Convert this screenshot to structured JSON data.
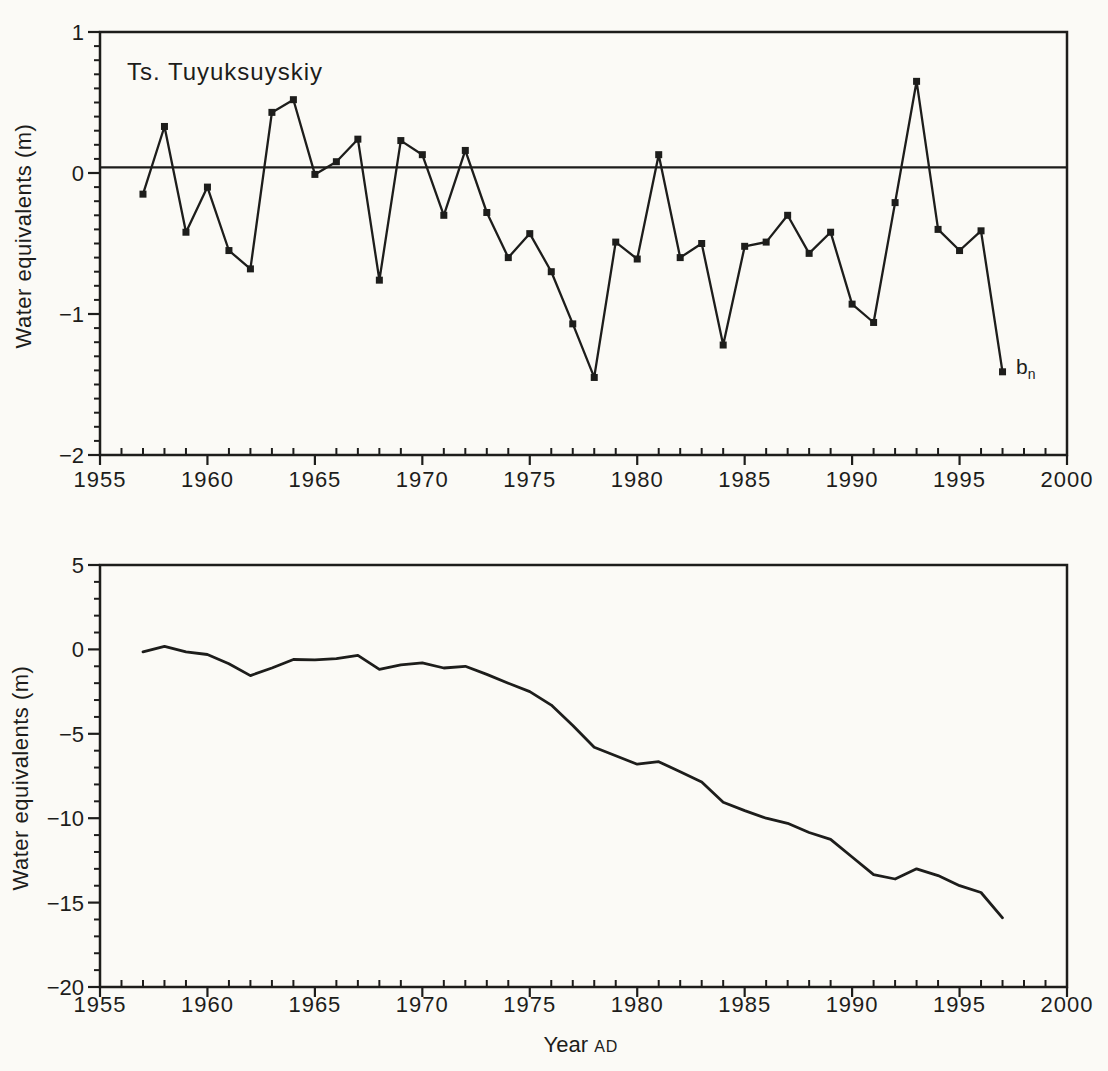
{
  "page": {
    "background": "#fbfaf6",
    "ink": "#1d1d1b"
  },
  "chart_data": [
    {
      "id": "annual",
      "type": "line",
      "title": "Ts. Tuyuksuyskiy",
      "ylabel": "Water equivalents (m)",
      "series_label": {
        "base": "b",
        "sub": "n"
      },
      "legend_position": "none",
      "grid": false,
      "marker": "square",
      "xlim": [
        1955,
        2000
      ],
      "ylim": [
        -2,
        1
      ],
      "x_minor_step": 1,
      "y_minor_step": 0.1,
      "x_major_ticks": [
        1955,
        1960,
        1965,
        1970,
        1975,
        1980,
        1985,
        1990,
        1995,
        2000
      ],
      "x_major_labels": [
        "1955",
        "1960",
        "1965",
        "1970",
        "1975",
        "1980",
        "1985",
        "1990",
        "1995",
        "2000"
      ],
      "y_major_ticks": [
        1,
        0,
        -1,
        -2
      ],
      "y_major_labels": [
        "1",
        "0",
        "−1",
        "−2"
      ],
      "reference_line_y": 0.04,
      "x": [
        1957,
        1958,
        1959,
        1960,
        1961,
        1962,
        1963,
        1964,
        1965,
        1966,
        1967,
        1968,
        1969,
        1970,
        1971,
        1972,
        1973,
        1974,
        1975,
        1976,
        1977,
        1978,
        1979,
        1980,
        1981,
        1982,
        1983,
        1984,
        1985,
        1986,
        1987,
        1988,
        1989,
        1990,
        1991,
        1992,
        1993,
        1994,
        1995,
        1996,
        1997
      ],
      "values": [
        -0.15,
        0.33,
        -0.42,
        -0.1,
        -0.55,
        -0.68,
        0.43,
        0.52,
        -0.01,
        0.08,
        0.24,
        -0.76,
        0.23,
        0.13,
        -0.3,
        0.16,
        -0.28,
        -0.6,
        -0.43,
        -0.7,
        -1.07,
        -1.45,
        -0.49,
        -0.61,
        0.13,
        -0.6,
        -0.5,
        -1.22,
        -0.52,
        -0.49,
        -0.3,
        -0.57,
        -0.42,
        -0.93,
        -1.06,
        -0.21,
        0.65,
        -0.4,
        -0.55,
        -0.41,
        -1.41
      ]
    },
    {
      "id": "cumulative",
      "type": "line",
      "title": "",
      "ylabel": "Water equivalents (m)",
      "xlabel": {
        "text": "Year",
        "suffix": "AD"
      },
      "legend_position": "none",
      "grid": false,
      "marker": "none",
      "xlim": [
        1955,
        2000
      ],
      "ylim": [
        -20,
        5
      ],
      "x_minor_step": 1,
      "y_minor_step": 1,
      "x_major_ticks": [
        1955,
        1960,
        1965,
        1970,
        1975,
        1980,
        1985,
        1990,
        1995,
        2000
      ],
      "x_major_labels": [
        "1955",
        "1960",
        "1965",
        "1970",
        "1975",
        "1980",
        "1985",
        "1990",
        "1995",
        "2000"
      ],
      "y_major_ticks": [
        5,
        0,
        -5,
        -10,
        -15,
        -20
      ],
      "y_major_labels": [
        "5",
        "0",
        "−5",
        "−10",
        "−15",
        "−20"
      ],
      "x": [
        1957,
        1958,
        1959,
        1960,
        1961,
        1962,
        1963,
        1964,
        1965,
        1966,
        1967,
        1968,
        1969,
        1970,
        1971,
        1972,
        1973,
        1974,
        1975,
        1976,
        1977,
        1978,
        1979,
        1980,
        1981,
        1982,
        1983,
        1984,
        1985,
        1986,
        1987,
        1988,
        1989,
        1990,
        1991,
        1992,
        1993,
        1994,
        1995,
        1996,
        1997
      ],
      "values": [
        -0.15,
        0.18,
        -0.15,
        -0.3,
        -0.85,
        -1.55,
        -1.1,
        -0.6,
        -0.62,
        -0.55,
        -0.35,
        -1.18,
        -0.92,
        -0.8,
        -1.1,
        -1.0,
        -1.48,
        -2.0,
        -2.5,
        -3.3,
        -4.5,
        -5.8,
        -6.3,
        -6.8,
        -6.65,
        -7.25,
        -7.85,
        -9.05,
        -9.55,
        -10.0,
        -10.3,
        -10.85,
        -11.25,
        -12.3,
        -13.35,
        -13.6,
        -13.0,
        -13.4,
        -14.0,
        -14.4,
        -15.9
      ]
    }
  ]
}
